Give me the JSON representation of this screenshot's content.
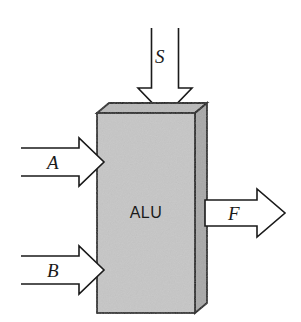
{
  "diagram": {
    "type": "block-diagram",
    "background_color": "#ffffff",
    "block": {
      "label": "ALU",
      "shape": "3d-box",
      "front_face_color": "#c6c6c6",
      "top_face_color": "#b9b9b9",
      "side_face_color": "#a8a8a8",
      "outline_color": "#1a1a1a"
    },
    "ports": [
      {
        "name": "S",
        "label": "S",
        "role": "control-input",
        "direction": "down",
        "side": "top",
        "arrow_style": "hollow-outline",
        "arrow_fill": "#ffffff",
        "arrow_outline": "#1a1a1a"
      },
      {
        "name": "A",
        "label": "A",
        "role": "data-input",
        "direction": "right",
        "side": "left-upper",
        "arrow_style": "hollow-outline",
        "arrow_fill": "#ffffff",
        "arrow_outline": "#1a1a1a"
      },
      {
        "name": "B",
        "label": "B",
        "role": "data-input",
        "direction": "right",
        "side": "left-lower",
        "arrow_style": "hollow-outline",
        "arrow_fill": "#ffffff",
        "arrow_outline": "#1a1a1a"
      },
      {
        "name": "F",
        "label": "F",
        "role": "data-output",
        "direction": "right",
        "side": "right",
        "arrow_style": "hollow-outline",
        "arrow_fill": "#ffffff",
        "arrow_outline": "#1a1a1a"
      }
    ]
  }
}
